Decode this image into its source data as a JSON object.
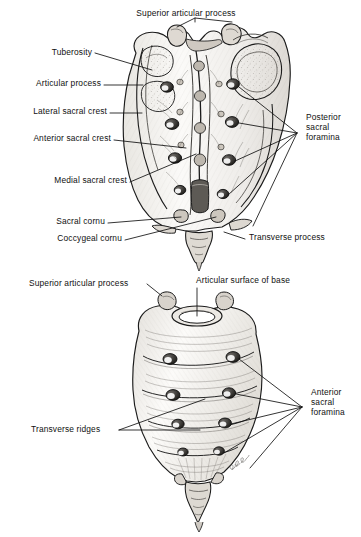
{
  "plate": {
    "title": "Sacrum and coccyx",
    "background_color": "#ffffff",
    "ink_color": "#111111",
    "width": 361,
    "height": 537,
    "signature": "Bjorn"
  },
  "figures": [
    {
      "id": "posterior-view",
      "view": "Posterior (dorsal) surface of sacrum and coccyx",
      "labels": [
        {
          "key": "superior-articular-process",
          "text": "Superior articular process",
          "x": 186,
          "y": 14,
          "align": "center",
          "lines": 1
        },
        {
          "key": "tuberosity",
          "text": "Tuberosity",
          "x": 92,
          "y": 53,
          "align": "right",
          "lines": 1
        },
        {
          "key": "articular-process",
          "text": "Articular process",
          "x": 101,
          "y": 84,
          "align": "right",
          "lines": 1
        },
        {
          "key": "lateral-sacral-crest",
          "text": "Lateral sacral crest",
          "x": 107,
          "y": 112,
          "align": "right",
          "lines": 1
        },
        {
          "key": "anterior-sacral-crest",
          "text": "Anterior sacral crest",
          "x": 111,
          "y": 139,
          "align": "right",
          "lines": 1
        },
        {
          "key": "medial-sacral-crest",
          "text": "Medial sacral crest",
          "x": 127,
          "y": 181,
          "align": "right",
          "lines": 1
        },
        {
          "key": "sacral-cornu",
          "text": "Sacral cornu",
          "x": 105,
          "y": 222,
          "align": "right",
          "lines": 1
        },
        {
          "key": "coccygeal-cornu",
          "text": "Coccygeal cornu",
          "x": 122,
          "y": 239,
          "align": "right",
          "lines": 1
        },
        {
          "key": "transverse-process",
          "text": "Transverse process",
          "x": 248,
          "y": 238,
          "align": "left",
          "lines": 1
        },
        {
          "key": "posterior-sacral-foramina",
          "text": "Posterior sacral foramina",
          "x": 307,
          "y": 118,
          "align": "left",
          "lines": 3
        }
      ]
    },
    {
      "id": "anterior-view",
      "view": "Anterior (pelvic) surface of sacrum and coccyx",
      "labels": [
        {
          "key": "superior-articular-process-2",
          "text": "Superior articular process",
          "x": 28,
          "y": 281,
          "align": "left",
          "lines": 1
        },
        {
          "key": "articular-surface-of-base",
          "text": "Articular surface of base",
          "x": 196,
          "y": 279,
          "align": "left",
          "lines": 1
        },
        {
          "key": "transverse-ridges",
          "text": "Transverse ridges",
          "x": 30,
          "y": 428,
          "align": "left",
          "lines": 1
        },
        {
          "key": "anterior-sacral-foramina",
          "text": "Anterior sacral foramina",
          "x": 312,
          "y": 393,
          "align": "left",
          "lines": 3
        }
      ]
    }
  ],
  "label_text": {
    "superior_articular_process": "Superior articular process",
    "tuberosity": "Tuberosity",
    "articular_process": "Articular process",
    "lateral_sacral_crest": "Lateral sacral crest",
    "anterior_sacral_crest": "Anterior sacral crest",
    "medial_sacral_crest": "Medial sacral crest",
    "sacral_cornu": "Sacral cornu",
    "coccygeal_cornu": "Coccygeal cornu",
    "transverse_process": "Transverse process",
    "posterior_sacral_foramina_l1": "Posterior",
    "posterior_sacral_foramina_l2": "sacral",
    "posterior_sacral_foramina_l3": "foramina",
    "superior_articular_process_2": "Superior articular process",
    "articular_surface_of_base": "Articular surface of base",
    "transverse_ridges": "Transverse ridges",
    "anterior_sacral_foramina_l1": "Anterior",
    "anterior_sacral_foramina_l2": "sacral",
    "anterior_sacral_foramina_l3": "foramina"
  }
}
